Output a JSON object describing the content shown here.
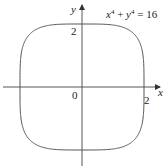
{
  "figure": {
    "equation": {
      "x_term": "x",
      "x_exp": "4",
      "plus": " + ",
      "y_term": "y",
      "y_exp": "4",
      "equals": " = 16"
    },
    "axes": {
      "x_label": "x",
      "y_label": "y",
      "origin_label": "0",
      "x_tick_label": "2",
      "y_tick_label": "2"
    },
    "curve": {
      "description": "Superellipse x^4 + y^4 = 16",
      "exponent": 4,
      "radius": 2
    },
    "colors": {
      "stroke": "#555555",
      "text": "#222222",
      "background": "#ffffff"
    }
  }
}
